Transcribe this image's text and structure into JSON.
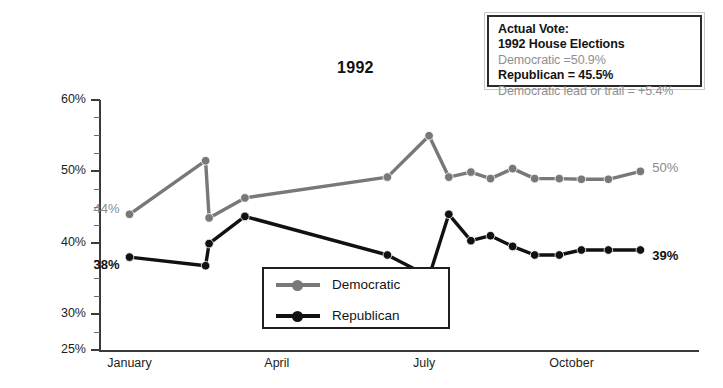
{
  "chart_data": {
    "type": "line",
    "title": "1992",
    "xlabel": "",
    "ylabel": "",
    "ylim": [
      25,
      60
    ],
    "y_ticks": [
      "60%",
      "50%",
      "40%",
      "30%",
      "25%"
    ],
    "y_tick_values": [
      60,
      50,
      40,
      30,
      25
    ],
    "x_tick_labels": [
      "January",
      "April",
      "July",
      "October"
    ],
    "x_tick_positions": [
      1,
      4,
      7,
      10
    ],
    "grid": false,
    "legend_position": "inside-bottom-center",
    "series": [
      {
        "name": "Democratic",
        "color": "#787878",
        "x": [
          1.0,
          2.55,
          2.62,
          3.35,
          6.25,
          7.1,
          7.5,
          7.95,
          8.35,
          8.8,
          9.25,
          9.75,
          10.2,
          10.75,
          11.4
        ],
        "values": [
          44.0,
          51.5,
          43.5,
          46.3,
          49.2,
          55.0,
          49.2,
          49.9,
          49.0,
          50.4,
          49.0,
          49.0,
          48.9,
          48.9,
          50.0
        ],
        "start_label": "44%",
        "end_label": "50%"
      },
      {
        "name": "Republican",
        "color": "#111111",
        "x": [
          1.0,
          2.55,
          2.62,
          3.35,
          6.25,
          7.1,
          7.5,
          7.95,
          8.35,
          8.8,
          9.25,
          9.75,
          10.2,
          10.75,
          11.4
        ],
        "values": [
          38.0,
          36.8,
          39.9,
          43.7,
          38.3,
          35.3,
          44.0,
          40.3,
          41.0,
          39.5,
          38.3,
          38.3,
          39.0,
          39.0,
          39.0
        ],
        "start_label": "38%",
        "end_label": "39%"
      }
    ]
  },
  "annotations": {
    "dem_start": "44%",
    "dem_end": "50%",
    "rep_start": "38%",
    "rep_end": "39%"
  },
  "legend": {
    "items": [
      {
        "label": "Democratic",
        "color": "#787878"
      },
      {
        "label": "Republican",
        "color": "#111111"
      }
    ]
  },
  "vote_box": {
    "line1": "Actual Vote:",
    "line2": "1992 House Elections",
    "line3": "Democratic =50.9%",
    "line4": "Republican = 45.5%",
    "line5": "Democratic lead or trail = +5.4%"
  },
  "colors": {
    "democratic": "#787878",
    "republican": "#111111",
    "axis": "#3a3a3a",
    "text": "#1d1d1d",
    "gray_text": "#8f8f8f"
  }
}
